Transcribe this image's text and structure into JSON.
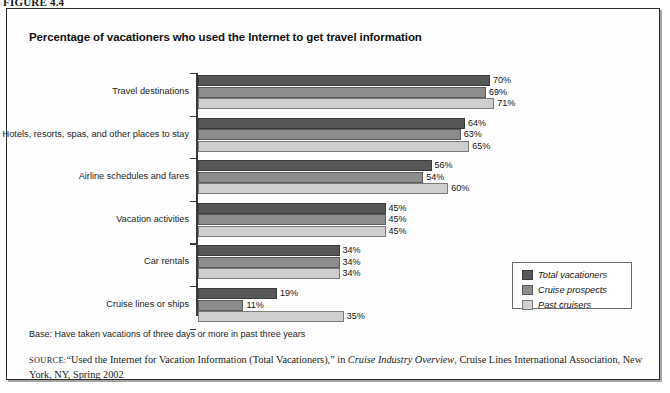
{
  "figure": {
    "caption": "FIGURE 4.4"
  },
  "chart": {
    "title": "Percentage of vacationers who used the Internet to get travel information"
  },
  "legend": {
    "position": "inside-bottom-right",
    "items": [
      {
        "label": "Total vacationers",
        "color": "#575757",
        "swatch_name": "legend-swatch-total-vacationers"
      },
      {
        "label": "Cruise prospects",
        "color": "#8d8d8d",
        "swatch_name": "legend-swatch-cruise-prospects"
      },
      {
        "label": "Past cruisers",
        "color": "#cfcfcf",
        "swatch_name": "legend-swatch-past-cruisers"
      }
    ]
  },
  "notes": {
    "base": "Base: Have taken vacations of three days or more in past three years",
    "source_prefix": "SOURCE:",
    "source_part1": "“Used the Internet for Vacation Information (Total Vacationers),” in ",
    "source_italic": "Cruise Industry Overview",
    "source_part2": ", Cruise Lines International Association, New York, NY, Spring 2002"
  },
  "chart_data": {
    "type": "bar",
    "orientation": "horizontal",
    "title": "Percentage of vacationers who used the Internet to get travel information",
    "xlabel": "",
    "ylabel": "",
    "xlim": [
      0,
      100
    ],
    "grid": false,
    "legend_position": "inside-bottom-right",
    "value_suffix": "%",
    "categories": [
      "Travel destinations",
      "Hotels, resorts, spas, and other places to stay",
      "Airline schedules and fares",
      "Vacation activities",
      "Car rentals",
      "Cruise lines or ships"
    ],
    "series": [
      {
        "name": "Total vacationers",
        "color": "#575757",
        "values": [
          70,
          64,
          56,
          45,
          34,
          19
        ],
        "labels": [
          "70%",
          "64%",
          "56%",
          "45%",
          "34%",
          "19%"
        ]
      },
      {
        "name": "Cruise prospects",
        "color": "#8d8d8d",
        "values": [
          69,
          63,
          54,
          45,
          34,
          11
        ],
        "labels": [
          "69%",
          "63%",
          "54%",
          "45%",
          "34%",
          "11%"
        ]
      },
      {
        "name": "Past cruisers",
        "color": "#cfcfcf",
        "values": [
          71,
          65,
          60,
          45,
          34,
          35
        ],
        "labels": [
          "71%",
          "65%",
          "60%",
          "45%",
          "34%",
          "35%"
        ]
      }
    ]
  }
}
